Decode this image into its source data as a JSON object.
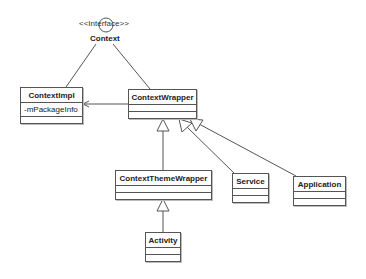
{
  "diagram": {
    "type": "UML class diagram",
    "interface": {
      "stereotype": "<<Interface>>",
      "name": "Context"
    },
    "classes": [
      {
        "id": "contextimpl",
        "name": "ContextImpl",
        "attributes": [
          "-mPackageInfo"
        ]
      },
      {
        "id": "contextwrapper",
        "name": "ContextWrapper",
        "attributes": []
      },
      {
        "id": "contextthemewrapper",
        "name": "ContextThemeWrapper",
        "attributes": []
      },
      {
        "id": "service",
        "name": "Service",
        "attributes": []
      },
      {
        "id": "application",
        "name": "Application",
        "attributes": []
      },
      {
        "id": "activity",
        "name": "Activity",
        "attributes": []
      }
    ],
    "relationships": [
      {
        "from": "ContextImpl",
        "to": "Context",
        "type": "realization"
      },
      {
        "from": "ContextWrapper",
        "to": "Context",
        "type": "realization"
      },
      {
        "from": "ContextWrapper",
        "to": "ContextImpl",
        "type": "association"
      },
      {
        "from": "ContextThemeWrapper",
        "to": "ContextWrapper",
        "type": "generalization"
      },
      {
        "from": "Service",
        "to": "ContextWrapper",
        "type": "generalization"
      },
      {
        "from": "Application",
        "to": "ContextWrapper",
        "type": "generalization"
      },
      {
        "from": "Activity",
        "to": "ContextThemeWrapper",
        "type": "generalization"
      }
    ]
  }
}
